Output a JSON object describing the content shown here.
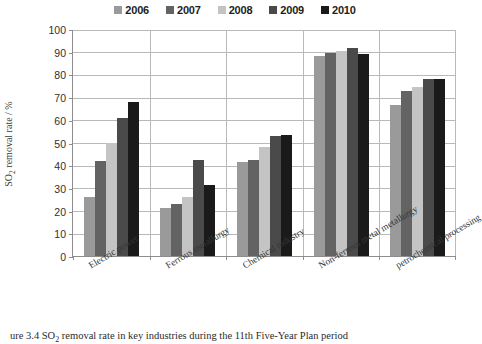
{
  "chart_data": {
    "type": "bar",
    "title": "",
    "xlabel": "",
    "ylabel": "SO2 removal rate / %",
    "ylabel_prefix": "SO",
    "ylabel_sub": "2",
    "ylabel_suffix": " removal rate / %",
    "ylim": [
      0,
      100
    ],
    "ytick_labels": [
      "0",
      "10",
      "20",
      "30",
      "40",
      "50",
      "60",
      "70",
      "80",
      "90",
      "100"
    ],
    "ytick_values": [
      0,
      10,
      20,
      30,
      40,
      50,
      60,
      70,
      80,
      90,
      100
    ],
    "grid": "horizontal-and-category-separators",
    "legend_position": "top-center",
    "categories": [
      "Electric power",
      "Ferrous metallurgy",
      "Chemical industry",
      "Non-ferrous metal metallurgy",
      "petrochemical processing"
    ],
    "series": [
      {
        "name": "2006",
        "color": "#9a9a9a",
        "values": [
          26.0,
          21.0,
          41.5,
          88.0,
          66.5
        ]
      },
      {
        "name": "2007",
        "color": "#636363",
        "values": [
          42.0,
          23.0,
          42.5,
          89.5,
          72.5
        ]
      },
      {
        "name": "2008",
        "color": "#c4c4c4",
        "values": [
          50.0,
          26.0,
          48.0,
          90.5,
          74.5
        ]
      },
      {
        "name": "2009",
        "color": "#4a4a4a",
        "values": [
          61.0,
          42.5,
          53.0,
          91.5,
          78.0
        ]
      },
      {
        "name": "2010",
        "color": "#1a1a1a",
        "values": [
          68.0,
          31.5,
          53.5,
          89.0,
          78.0
        ]
      }
    ]
  },
  "caption": {
    "prefix": "ure 3.4  SO",
    "sub": "2",
    "suffix": " removal rate in key industries during the 11th Five-Year Plan period"
  }
}
